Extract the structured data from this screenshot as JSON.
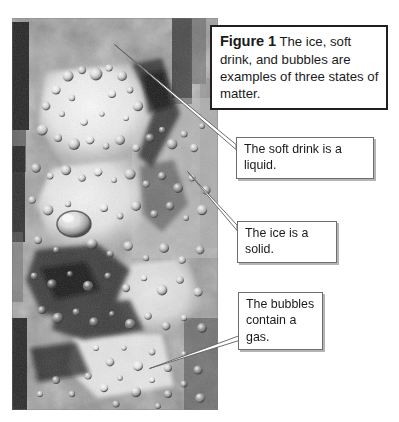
{
  "figure": {
    "label": "Figure 1",
    "caption": "The ice, soft drink, and bubbles are examples of three states of matter.",
    "background_color": "#ffffff",
    "caption_border_color": "#231f20"
  },
  "photo": {
    "alt_name": "photograph-carbonated-soft-drink-with-ice-and-bubbles",
    "description": "Black and white close-up photograph of ice cubes in a carbonated soft drink with many gas bubbles",
    "is_grayscale": true,
    "width": 206,
    "height": 392
  },
  "callouts": [
    {
      "id": "liquid",
      "text": "The soft drink is a liquid.",
      "border_color": "#6e6e6e",
      "background_color": "#ffffff",
      "points_to": "soft drink"
    },
    {
      "id": "solid",
      "text": "The ice is a solid.",
      "border_color": "#6e6e6e",
      "background_color": "#ffffff",
      "points_to": "ice cube"
    },
    {
      "id": "gas",
      "text": "The bubbles\ncontain a gas.",
      "border_color": "#6e6e6e",
      "background_color": "#ffffff",
      "points_to": "bubbles"
    }
  ],
  "leader_lines": [
    {
      "id": "leader-liquid",
      "from": "callout-liquid",
      "to_point_x": 115,
      "to_point_y": 45
    },
    {
      "id": "leader-solid",
      "from": "callout-solid",
      "to_point_x": 188,
      "to_point_y": 172
    },
    {
      "id": "leader-gas",
      "from": "callout-gas",
      "to_point_x": 152,
      "to_point_y": 368
    }
  ]
}
